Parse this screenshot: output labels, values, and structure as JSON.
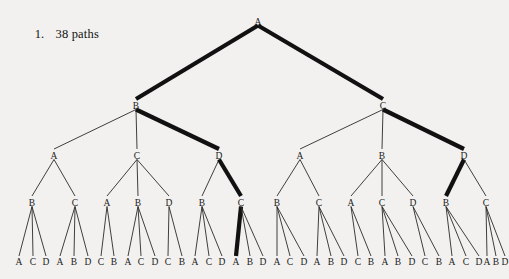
{
  "caption": {
    "number": "1.",
    "text": "38 paths"
  },
  "colors": {
    "background": "#f2f1ef",
    "ink": "#1a1a1a",
    "bold_path": "#111111"
  },
  "tree": {
    "title": "38 paths",
    "leaf_count": 38,
    "depth": 5,
    "root": "A",
    "bold_path_labels": [
      "A",
      "B",
      "D",
      "C",
      "A"
    ],
    "levels": [
      {
        "level": 1,
        "labels": [
          "A"
        ]
      },
      {
        "level": 2,
        "labels": [
          "B",
          "C"
        ]
      },
      {
        "level": 3,
        "labels": [
          "A",
          "C",
          "D",
          "A",
          "B",
          "D"
        ]
      },
      {
        "level": 4,
        "labels": [
          "B",
          "C",
          "A",
          "B",
          "D",
          "B",
          "C",
          "B",
          "C",
          "A",
          "C",
          "D",
          "B",
          "C"
        ]
      },
      {
        "level": 5,
        "labels": [
          "A",
          "C",
          "D",
          "A",
          "B",
          "D",
          "C",
          "B",
          "A",
          "C",
          "D",
          "C",
          "B",
          "A",
          "C",
          "D",
          "A",
          "B",
          "D",
          "A",
          "C",
          "D",
          "A",
          "B",
          "D",
          "C",
          "B",
          "A",
          "B",
          "D",
          "C",
          "B",
          "A",
          "C",
          "D",
          "A",
          "B",
          "D"
        ]
      }
    ],
    "nodes": [
      {
        "id": "n0",
        "label": "A",
        "x": 258,
        "y": 22,
        "level": 1
      },
      {
        "id": "n1",
        "label": "B",
        "x": 136,
        "y": 106,
        "level": 2
      },
      {
        "id": "n2",
        "label": "C",
        "x": 383,
        "y": 106,
        "level": 2
      },
      {
        "id": "n1a",
        "label": "A",
        "x": 54,
        "y": 156,
        "level": 3
      },
      {
        "id": "n1b",
        "label": "C",
        "x": 137,
        "y": 156,
        "level": 3
      },
      {
        "id": "n1c",
        "label": "D",
        "x": 219,
        "y": 156,
        "level": 3
      },
      {
        "id": "n2a",
        "label": "A",
        "x": 300,
        "y": 156,
        "level": 3
      },
      {
        "id": "n2b",
        "label": "B",
        "x": 382,
        "y": 156,
        "level": 3
      },
      {
        "id": "n2c",
        "label": "D",
        "x": 464,
        "y": 156,
        "level": 3
      },
      {
        "id": "m1",
        "label": "B",
        "x": 32,
        "y": 203,
        "level": 4
      },
      {
        "id": "m2",
        "label": "C",
        "x": 75,
        "y": 203,
        "level": 4
      },
      {
        "id": "m3",
        "label": "A",
        "x": 107,
        "y": 203,
        "level": 4
      },
      {
        "id": "m4",
        "label": "B",
        "x": 138,
        "y": 203,
        "level": 4
      },
      {
        "id": "m5",
        "label": "D",
        "x": 169,
        "y": 203,
        "level": 4
      },
      {
        "id": "m6",
        "label": "B",
        "x": 202,
        "y": 203,
        "level": 4
      },
      {
        "id": "m7",
        "label": "C",
        "x": 241,
        "y": 203,
        "level": 4
      },
      {
        "id": "m8",
        "label": "B",
        "x": 277,
        "y": 203,
        "level": 4
      },
      {
        "id": "m9",
        "label": "C",
        "x": 319,
        "y": 203,
        "level": 4
      },
      {
        "id": "m10",
        "label": "A",
        "x": 351,
        "y": 203,
        "level": 4
      },
      {
        "id": "m11",
        "label": "C",
        "x": 382,
        "y": 203,
        "level": 4
      },
      {
        "id": "m12",
        "label": "D",
        "x": 413,
        "y": 203,
        "level": 4
      },
      {
        "id": "m13",
        "label": "B",
        "x": 446,
        "y": 203,
        "level": 4
      },
      {
        "id": "m14",
        "label": "C",
        "x": 486,
        "y": 203,
        "level": 4
      }
    ],
    "leaves": [
      {
        "label": "A",
        "x": 19,
        "parent": "m1"
      },
      {
        "label": "C",
        "x": 33,
        "parent": "m1"
      },
      {
        "label": "D",
        "x": 46,
        "parent": "m1"
      },
      {
        "label": "A",
        "x": 60,
        "parent": "m2"
      },
      {
        "label": "B",
        "x": 74,
        "parent": "m2"
      },
      {
        "label": "D",
        "x": 88,
        "parent": "m2"
      },
      {
        "label": "C",
        "x": 101,
        "parent": "m3"
      },
      {
        "label": "B",
        "x": 114,
        "parent": "m3"
      },
      {
        "label": "A",
        "x": 128,
        "parent": "m4"
      },
      {
        "label": "C",
        "x": 141,
        "parent": "m4"
      },
      {
        "label": "D",
        "x": 155,
        "parent": "m4"
      },
      {
        "label": "C",
        "x": 168,
        "parent": "m5"
      },
      {
        "label": "B",
        "x": 182,
        "parent": "m5"
      },
      {
        "label": "A",
        "x": 195,
        "parent": "m6"
      },
      {
        "label": "C",
        "x": 209,
        "parent": "m6"
      },
      {
        "label": "D",
        "x": 222,
        "parent": "m6"
      },
      {
        "label": "A",
        "x": 236,
        "parent": "m7"
      },
      {
        "label": "B",
        "x": 250,
        "parent": "m7"
      },
      {
        "label": "D",
        "x": 263,
        "parent": "m7"
      },
      {
        "label": "A",
        "x": 277,
        "parent": "m8"
      },
      {
        "label": "C",
        "x": 290,
        "parent": "m8"
      },
      {
        "label": "D",
        "x": 304,
        "parent": "m8"
      },
      {
        "label": "A",
        "x": 317,
        "parent": "m9"
      },
      {
        "label": "B",
        "x": 331,
        "parent": "m9"
      },
      {
        "label": "D",
        "x": 344,
        "parent": "m9"
      },
      {
        "label": "C",
        "x": 358,
        "parent": "m10"
      },
      {
        "label": "B",
        "x": 371,
        "parent": "m10"
      },
      {
        "label": "A",
        "x": 385,
        "parent": "m11"
      },
      {
        "label": "B",
        "x": 398,
        "parent": "m11"
      },
      {
        "label": "D",
        "x": 412,
        "parent": "m11"
      },
      {
        "label": "C",
        "x": 425,
        "parent": "m12"
      },
      {
        "label": "B",
        "x": 439,
        "parent": "m12"
      },
      {
        "label": "A",
        "x": 452,
        "parent": "m13"
      },
      {
        "label": "C",
        "x": 466,
        "parent": "m13"
      },
      {
        "label": "D",
        "x": 479,
        "parent": "m13"
      },
      {
        "label": "A",
        "x": 487,
        "parent": "m14"
      },
      {
        "label": "B",
        "x": 496,
        "parent": "m14"
      },
      {
        "label": "D",
        "x": 505,
        "parent": "m14"
      }
    ],
    "edges": [
      {
        "from": "n0",
        "to": "n1",
        "bold": true
      },
      {
        "from": "n0",
        "to": "n2",
        "bold": true
      },
      {
        "from": "n1",
        "to": "n1a",
        "bold": false
      },
      {
        "from": "n1",
        "to": "n1b",
        "bold": false
      },
      {
        "from": "n1",
        "to": "n1c",
        "bold": true
      },
      {
        "from": "n2",
        "to": "n2a",
        "bold": false
      },
      {
        "from": "n2",
        "to": "n2b",
        "bold": false
      },
      {
        "from": "n2",
        "to": "n2c",
        "bold": true
      },
      {
        "from": "n1a",
        "to": "m1",
        "bold": false
      },
      {
        "from": "n1a",
        "to": "m2",
        "bold": false
      },
      {
        "from": "n1b",
        "to": "m3",
        "bold": false
      },
      {
        "from": "n1b",
        "to": "m4",
        "bold": false
      },
      {
        "from": "n1b",
        "to": "m5",
        "bold": false
      },
      {
        "from": "n1c",
        "to": "m6",
        "bold": false
      },
      {
        "from": "n1c",
        "to": "m7",
        "bold": true
      },
      {
        "from": "n2a",
        "to": "m8",
        "bold": false
      },
      {
        "from": "n2a",
        "to": "m9",
        "bold": false
      },
      {
        "from": "n2b",
        "to": "m10",
        "bold": false
      },
      {
        "from": "n2b",
        "to": "m11",
        "bold": false
      },
      {
        "from": "n2b",
        "to": "m12",
        "bold": false
      },
      {
        "from": "n2c",
        "to": "m13",
        "bold": true
      },
      {
        "from": "n2c",
        "to": "m14",
        "bold": false
      }
    ],
    "bold_leaf_index": 16
  }
}
